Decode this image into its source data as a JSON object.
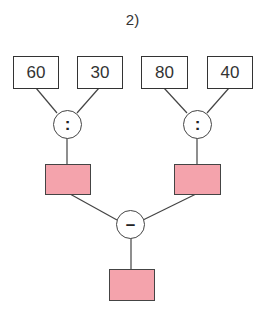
{
  "title": "2)",
  "diagram": {
    "inputs": [
      "60",
      "30",
      "80",
      "40"
    ],
    "operators": {
      "left": ":",
      "right": ":",
      "bottom": "–"
    },
    "result_boxes": {
      "left": "",
      "right": "",
      "final": ""
    },
    "colors": {
      "result_fill": "#f4a3ac",
      "stroke": "#333333"
    }
  }
}
